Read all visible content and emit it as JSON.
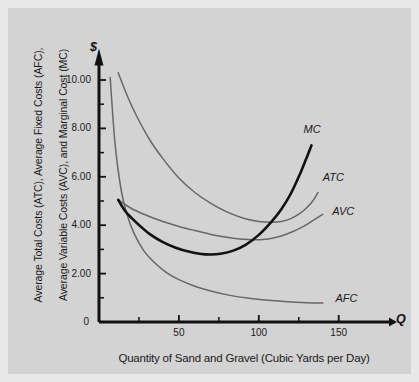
{
  "figure": {
    "background_color": "#d3d3d3",
    "axis_color": "#111111",
    "dollar_symbol": "$",
    "quantity_symbol": "Q"
  },
  "chart_data": {
    "type": "line",
    "title": "",
    "xlabel": "Quantity of Sand and Gravel (Cubic Yards per Day)",
    "ylabel_line1": "Average Total Costs (ATC), Average Fixed Costs (AFC),",
    "ylabel_line2": "Average Variable Costs (AVC), and Marginal Cost (MC)",
    "xlim": [
      0,
      175
    ],
    "ylim": [
      0,
      11
    ],
    "grid": false,
    "legend_position": "inline-curve-labels",
    "xticks": [
      50,
      100,
      150
    ],
    "xtick_labels": [
      "50",
      "100",
      "150"
    ],
    "xminor_ticks": [
      25,
      75,
      125
    ],
    "yticks": [
      0,
      2,
      4,
      6,
      8,
      10
    ],
    "ytick_labels": [
      "0",
      "2.00",
      "4.00",
      "6.00",
      "8.00",
      "10.00"
    ],
    "yminor_ticks": [
      1,
      3,
      5,
      7,
      9
    ],
    "series": [
      {
        "name": "MC",
        "label": "MC",
        "color": "#111111",
        "width": 2.6,
        "points": [
          [
            12,
            5.05
          ],
          [
            16,
            4.62
          ],
          [
            20,
            4.32
          ],
          [
            26,
            3.95
          ],
          [
            32,
            3.62
          ],
          [
            40,
            3.3
          ],
          [
            48,
            3.07
          ],
          [
            56,
            2.91
          ],
          [
            64,
            2.81
          ],
          [
            70,
            2.79
          ],
          [
            76,
            2.82
          ],
          [
            84,
            2.95
          ],
          [
            92,
            3.2
          ],
          [
            100,
            3.6
          ],
          [
            108,
            4.15
          ],
          [
            114,
            4.65
          ],
          [
            120,
            5.3
          ],
          [
            126,
            6.15
          ],
          [
            130,
            6.8
          ],
          [
            133,
            7.3
          ]
        ]
      },
      {
        "name": "ATC",
        "label": "ATC",
        "color": "#676767",
        "width": 1.5,
        "points": [
          [
            12,
            10.3
          ],
          [
            18,
            9.3
          ],
          [
            24,
            8.45
          ],
          [
            32,
            7.5
          ],
          [
            40,
            6.75
          ],
          [
            50,
            5.95
          ],
          [
            60,
            5.35
          ],
          [
            70,
            4.9
          ],
          [
            80,
            4.55
          ],
          [
            90,
            4.3
          ],
          [
            100,
            4.15
          ],
          [
            108,
            4.12
          ],
          [
            114,
            4.15
          ],
          [
            120,
            4.27
          ],
          [
            126,
            4.5
          ],
          [
            130,
            4.72
          ],
          [
            134,
            5.02
          ],
          [
            137,
            5.35
          ]
        ]
      },
      {
        "name": "AVC",
        "label": "AVC",
        "color": "#676767",
        "width": 1.5,
        "points": [
          [
            12,
            5.05
          ],
          [
            20,
            4.7
          ],
          [
            30,
            4.4
          ],
          [
            40,
            4.15
          ],
          [
            50,
            3.95
          ],
          [
            60,
            3.78
          ],
          [
            70,
            3.62
          ],
          [
            80,
            3.5
          ],
          [
            90,
            3.42
          ],
          [
            98,
            3.4
          ],
          [
            106,
            3.43
          ],
          [
            114,
            3.55
          ],
          [
            120,
            3.7
          ],
          [
            128,
            3.95
          ],
          [
            134,
            4.2
          ],
          [
            140,
            4.45
          ]
        ]
      },
      {
        "name": "AFC",
        "label": "AFC",
        "color": "#676767",
        "width": 1.5,
        "points": [
          [
            7,
            10.1
          ],
          [
            10,
            7.4
          ],
          [
            14,
            5.4
          ],
          [
            18,
            4.35
          ],
          [
            22,
            3.65
          ],
          [
            28,
            2.95
          ],
          [
            34,
            2.5
          ],
          [
            42,
            2.05
          ],
          [
            50,
            1.75
          ],
          [
            60,
            1.48
          ],
          [
            70,
            1.28
          ],
          [
            82,
            1.1
          ],
          [
            94,
            0.98
          ],
          [
            106,
            0.9
          ],
          [
            118,
            0.84
          ],
          [
            130,
            0.8
          ],
          [
            140,
            0.78
          ]
        ]
      }
    ],
    "curve_labels": [
      {
        "text": "MC",
        "x": 128,
        "y": 7.95
      },
      {
        "text": "ATC",
        "x": 140,
        "y": 5.95
      },
      {
        "text": "AVC",
        "x": 146,
        "y": 4.55
      },
      {
        "text": "AFC",
        "x": 148,
        "y": 0.95
      }
    ]
  }
}
